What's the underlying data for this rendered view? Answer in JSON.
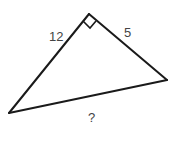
{
  "diagram": {
    "type": "right-triangle",
    "vertices": {
      "apex": [
        89,
        14
      ],
      "left": [
        9,
        113
      ],
      "right": [
        167,
        80
      ]
    },
    "right_angle_marker": {
      "points": [
        [
          83,
          21
        ],
        [
          90,
          28
        ],
        [
          96,
          21
        ]
      ]
    },
    "labels": {
      "left_leg": {
        "text": "12",
        "x": 49,
        "y": 41
      },
      "right_leg": {
        "text": "5",
        "x": 124,
        "y": 37
      },
      "hypotenuse": {
        "text": "?",
        "x": 88,
        "y": 122
      }
    },
    "colors": {
      "stroke": "#1a1a1a",
      "label": "#444444",
      "background": "#ffffff"
    }
  }
}
